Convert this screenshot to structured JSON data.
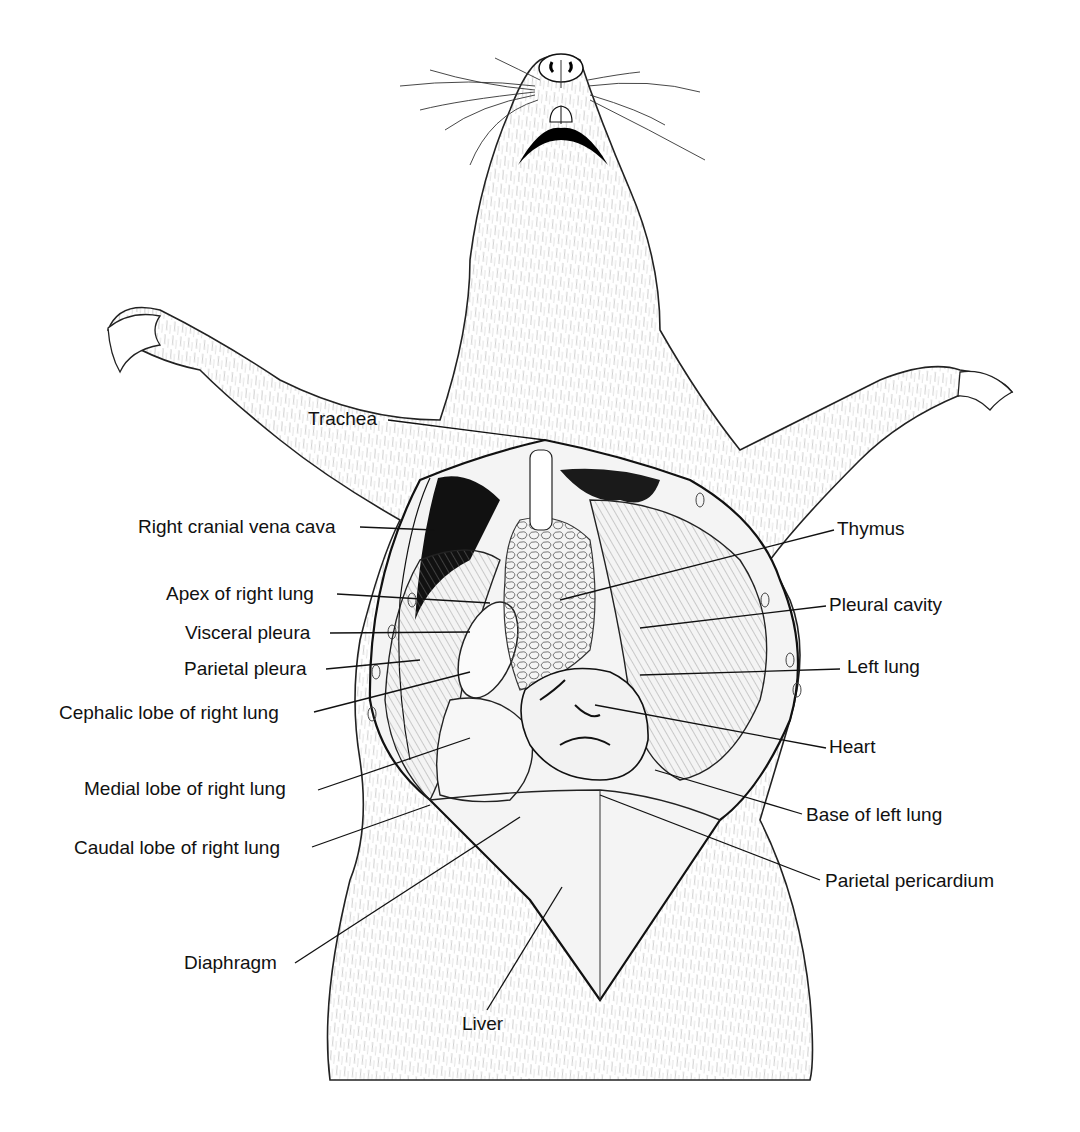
{
  "figure": {
    "labels_left": [
      {
        "id": "trachea",
        "text": "Trachea",
        "x": 308,
        "y": 408,
        "lx1": 388,
        "ly1": 420,
        "lx2": 545,
        "ly2": 440
      },
      {
        "id": "right-cranial-vena-cava",
        "text": "Right cranial vena cava",
        "x": 138,
        "y": 516,
        "lx1": 360,
        "ly1": 527,
        "lx2": 435,
        "ly2": 530
      },
      {
        "id": "apex-of-right-lung",
        "text": "Apex of right lung",
        "x": 166,
        "y": 583,
        "lx1": 337,
        "ly1": 594,
        "lx2": 490,
        "ly2": 603
      },
      {
        "id": "visceral-pleura",
        "text": "Visceral pleura",
        "x": 185,
        "y": 622,
        "lx1": 330,
        "ly1": 633,
        "lx2": 470,
        "ly2": 632
      },
      {
        "id": "parietal-pleura",
        "text": "Parietal pleura",
        "x": 184,
        "y": 658,
        "lx1": 326,
        "ly1": 669,
        "lx2": 420,
        "ly2": 660
      },
      {
        "id": "cephalic-lobe-of-right-lung",
        "text": "Cephalic lobe of right lung",
        "x": 59,
        "y": 702,
        "lx1": 314,
        "ly1": 712,
        "lx2": 470,
        "ly2": 672
      },
      {
        "id": "medial-lobe-of-right-lung",
        "text": "Medial lobe of right lung",
        "x": 84,
        "y": 778,
        "lx1": 318,
        "ly1": 790,
        "lx2": 470,
        "ly2": 738
      },
      {
        "id": "caudal-lobe-of-right-lung",
        "text": "Caudal lobe of right lung",
        "x": 74,
        "y": 837,
        "lx1": 312,
        "ly1": 847,
        "lx2": 430,
        "ly2": 805
      },
      {
        "id": "diaphragm",
        "text": "Diaphragm",
        "x": 184,
        "y": 952,
        "lx1": 295,
        "ly1": 963,
        "lx2": 520,
        "ly2": 817
      },
      {
        "id": "liver",
        "text": "Liver",
        "x": 462,
        "y": 1013,
        "lx1": 487,
        "ly1": 1010,
        "lx2": 562,
        "ly2": 887
      }
    ],
    "labels_right": [
      {
        "id": "thymus",
        "text": "Thymus",
        "x": 837,
        "y": 518,
        "lx1": 834,
        "ly1": 530,
        "lx2": 560,
        "ly2": 600
      },
      {
        "id": "pleural-cavity",
        "text": "Pleural cavity",
        "x": 829,
        "y": 594,
        "lx1": 826,
        "ly1": 606,
        "lx2": 640,
        "ly2": 628
      },
      {
        "id": "left-lung",
        "text": "Left lung",
        "x": 847,
        "y": 656,
        "lx1": 840,
        "ly1": 669,
        "lx2": 640,
        "ly2": 675
      },
      {
        "id": "heart",
        "text": "Heart",
        "x": 829,
        "y": 736,
        "lx1": 826,
        "ly1": 748,
        "lx2": 595,
        "ly2": 705
      },
      {
        "id": "base-of-left-lung",
        "text": "Base of left lung",
        "x": 806,
        "y": 804,
        "lx1": 802,
        "ly1": 814,
        "lx2": 655,
        "ly2": 770
      },
      {
        "id": "parietal-pericardium",
        "text": "Parietal pericardium",
        "x": 825,
        "y": 870,
        "lx1": 820,
        "ly1": 880,
        "lx2": 600,
        "ly2": 795
      }
    ]
  }
}
